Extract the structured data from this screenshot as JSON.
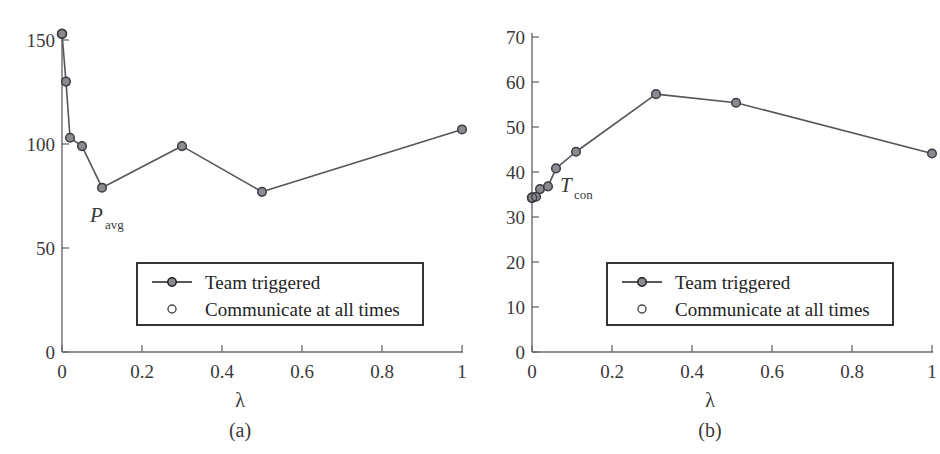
{
  "figure": {
    "panels": [
      {
        "id": "a",
        "caption": "(a)",
        "curve_label_main": "P",
        "curve_label_sub": "avg",
        "xlabel": "λ",
        "legend": {
          "team_triggered": "Team triggered",
          "communicate_all": "Communicate at all times"
        }
      },
      {
        "id": "b",
        "caption": "(b)",
        "curve_label_main": "T",
        "curve_label_sub": "con",
        "xlabel": "λ",
        "legend": {
          "team_triggered": "Team triggered",
          "communicate_all": "Communicate at all times"
        }
      }
    ]
  },
  "chart_data": [
    {
      "type": "line",
      "panel": "a",
      "title": "",
      "xlabel": "λ",
      "ylabel": "P_avg",
      "xlim": [
        0,
        1
      ],
      "ylim": [
        0,
        160
      ],
      "xticks": [
        0,
        0.2,
        0.4,
        0.6,
        0.8,
        1
      ],
      "xticklabels": [
        "0",
        "0.2",
        "0.4",
        "0.6",
        "0.8",
        "1"
      ],
      "yticks": [
        0,
        50,
        100,
        150
      ],
      "yticklabels": [
        "0",
        "50",
        "100",
        "150"
      ],
      "grid": false,
      "legend_position": "lower-center",
      "series": [
        {
          "name": "Team triggered",
          "marker": "circle",
          "line": true,
          "x": [
            0,
            0.01,
            0.02,
            0.05,
            0.1,
            0.3,
            0.5,
            1
          ],
          "values": [
            153,
            130,
            103,
            99,
            79,
            99,
            77,
            107
          ]
        },
        {
          "name": "Communicate at all times",
          "marker": "open-circle",
          "line": false,
          "x": [
            0
          ],
          "values": [
            153
          ]
        }
      ]
    },
    {
      "type": "line",
      "panel": "b",
      "title": "",
      "xlabel": "λ",
      "ylabel": "T_con",
      "xlim": [
        0,
        1
      ],
      "ylim": [
        0,
        70
      ],
      "xticks": [
        0,
        0.2,
        0.4,
        0.6,
        0.8,
        1
      ],
      "xticklabels": [
        "0",
        "0.2",
        "0.4",
        "0.6",
        "0.8",
        "1"
      ],
      "yticks": [
        0,
        10,
        20,
        30,
        40,
        50,
        60,
        70
      ],
      "yticklabels": [
        "0",
        "10",
        "20",
        "30",
        "40",
        "50",
        "60",
        "70"
      ],
      "grid": false,
      "legend_position": "lower-center",
      "series": [
        {
          "name": "Team triggered",
          "marker": "circle",
          "line": true,
          "x": [
            0,
            0.01,
            0.02,
            0.04,
            0.06,
            0.11,
            0.31,
            0.51,
            1
          ],
          "values": [
            34.3,
            34.5,
            36.2,
            36.8,
            40.8,
            44.5,
            57.3,
            55.4,
            44.1
          ]
        },
        {
          "name": "Communicate at all times",
          "marker": "open-circle",
          "line": false,
          "x": [
            0
          ],
          "values": [
            34.3
          ]
        }
      ]
    }
  ],
  "style": {
    "line_color": "#55555a",
    "marker_fill": "#8a8a90",
    "marker_stroke": "#3c3c42",
    "axis_color": "#6a6a70",
    "text_color": "#3a3a3a",
    "legend_border": "#1f1f1f"
  }
}
